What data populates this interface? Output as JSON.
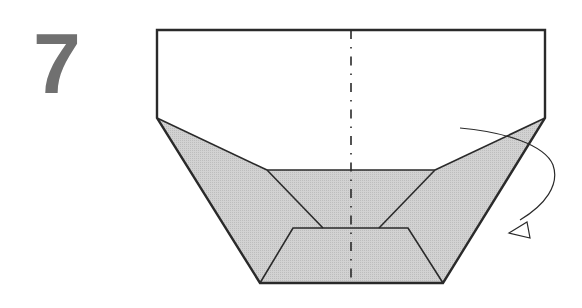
{
  "step": {
    "number": "7"
  },
  "diagram": {
    "fill_color": "#cfcfcf",
    "stroke_color": "#2a2a2a",
    "center_line": "valley/mountain fold line (dash-dot)",
    "arrow": "turn over / rotate arrow"
  }
}
